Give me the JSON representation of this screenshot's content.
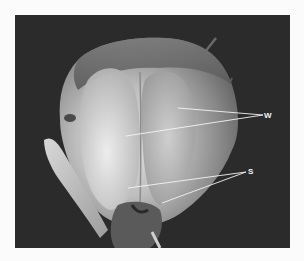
{
  "figure": {
    "colors": {
      "background_margin": "#fbfbfb",
      "photo_background": "#2b2b2b",
      "annotation": "#f4f4f4"
    },
    "labels": [
      {
        "id": "w",
        "text": "W",
        "x": 264,
        "y": 112,
        "targets": [
          [
            178,
            108
          ],
          [
            126,
            136
          ]
        ]
      },
      {
        "id": "s",
        "text": "S",
        "x": 248,
        "y": 168,
        "targets": [
          [
            128,
            188
          ],
          [
            162,
            203
          ]
        ]
      }
    ]
  }
}
